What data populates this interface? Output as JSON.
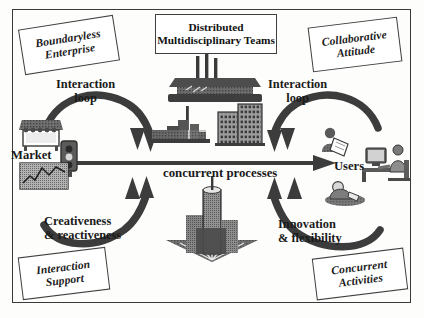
{
  "figure": {
    "title_visible": false,
    "center_flow_label": "concurrent processes",
    "ink_color": "#2e2e2e",
    "box_border_color": "#3f3f3f",
    "background_color": "#ffffff"
  },
  "corner_tags": {
    "top_left": {
      "line1": "Boundaryless",
      "line2": "Enterprise"
    },
    "top_right": {
      "line1": "Collaborative",
      "line2": "Attitude"
    },
    "bottom_left": {
      "line1": "Interaction",
      "line2": "Support"
    },
    "bottom_right": {
      "line1": "Concurrent",
      "line2": "Activities"
    }
  },
  "top_center_tag": {
    "line1": "Distributed",
    "line2": "Multidisciplinary Teams"
  },
  "loop_labels": {
    "left": {
      "line1": "Interaction",
      "line2": "loop"
    },
    "right": {
      "line1": "Interaction",
      "line2": "loop"
    }
  },
  "bottom_labels": {
    "left": {
      "line1": "Creativeness",
      "line2": "& reactiveness"
    },
    "right": {
      "line1": "Innovation",
      "line2": "& flexibility"
    }
  },
  "endpoints": {
    "left": {
      "label": "Market",
      "icons": [
        "market-stall-icon",
        "traffic-light-icon",
        "stock-chart-icon"
      ]
    },
    "right": {
      "label": "Users",
      "icons": [
        "person-reading-icon",
        "person-at-computer-icon",
        "seated-person-icon"
      ]
    }
  },
  "center_icons": {
    "top": [
      "factory-complex-icon",
      "industrial-plant-icon",
      "office-building-icon"
    ],
    "bottom": [
      "skyscraper-cluster-icon"
    ]
  },
  "arrows": [
    {
      "name": "arrow-top-left-inbound",
      "from": "Market",
      "to": "center-top",
      "direction": "down"
    },
    {
      "name": "arrow-top-right-inbound",
      "from": "Users",
      "to": "center-top",
      "direction": "down"
    },
    {
      "name": "arrow-bottom-left-inbound",
      "from": "Market",
      "to": "center-bottom",
      "direction": "up"
    },
    {
      "name": "arrow-bottom-right-inbound",
      "from": "Users",
      "to": "center-bottom",
      "direction": "up"
    },
    {
      "name": "arrow-concurrent-processes",
      "from": "Market",
      "to": "Users",
      "direction": "right"
    }
  ]
}
